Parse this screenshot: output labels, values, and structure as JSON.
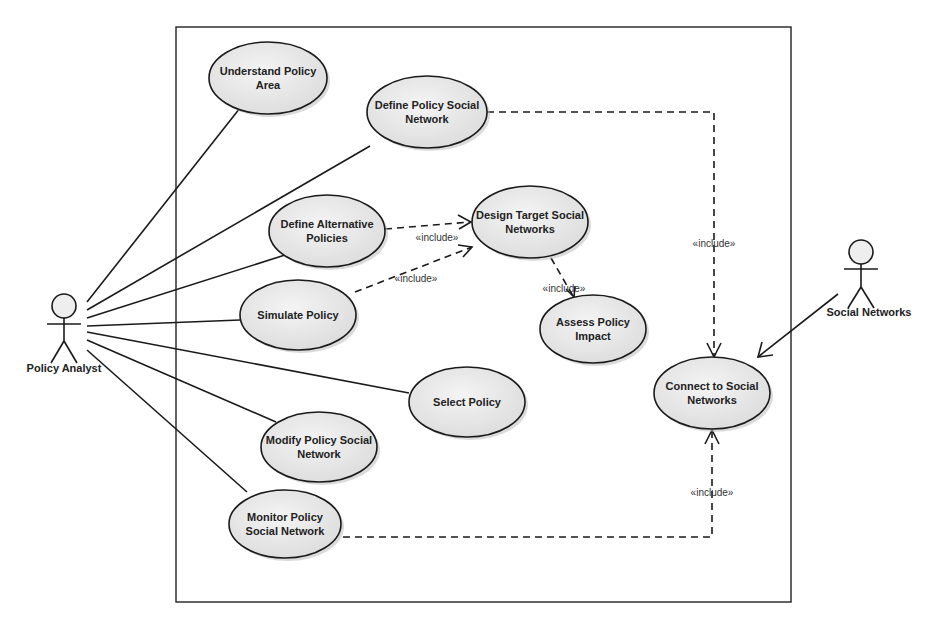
{
  "diagram": {
    "type": "uml-use-case",
    "system_boundary": {
      "x": 176,
      "y": 27,
      "width": 615,
      "height": 575
    },
    "actors": [
      {
        "id": "policy_analyst",
        "label": "Policy Analyst",
        "x": 64,
        "y": 300
      },
      {
        "id": "social_networks",
        "label": "Social Networks",
        "x": 861,
        "y": 263
      }
    ],
    "use_cases": [
      {
        "id": "understand",
        "line1": "Understand Policy",
        "line2": "Area",
        "cx": 268,
        "cy": 78,
        "rx": 59,
        "ry": 36
      },
      {
        "id": "define_psn",
        "line1": "Define Policy Social",
        "line2": "Network",
        "cx": 427,
        "cy": 112,
        "rx": 60,
        "ry": 36
      },
      {
        "id": "define_alt",
        "line1": "Define Alternative",
        "line2": "Policies",
        "cx": 327,
        "cy": 231,
        "rx": 58,
        "ry": 36
      },
      {
        "id": "design_target",
        "line1": "Design Target Social",
        "line2": "Networks",
        "cx": 530,
        "cy": 222,
        "rx": 58,
        "ry": 36
      },
      {
        "id": "simulate",
        "line1": "Simulate Policy",
        "line2": "",
        "cx": 298,
        "cy": 315,
        "rx": 58,
        "ry": 35
      },
      {
        "id": "assess",
        "line1": "Assess Policy",
        "line2": "Impact",
        "cx": 593,
        "cy": 329,
        "rx": 53,
        "ry": 34
      },
      {
        "id": "select",
        "line1": "Select Policy",
        "line2": "",
        "cx": 467,
        "cy": 402,
        "rx": 58,
        "ry": 35
      },
      {
        "id": "modify",
        "line1": "Modify Policy Social",
        "line2": "Network",
        "cx": 319,
        "cy": 447,
        "rx": 58,
        "ry": 35
      },
      {
        "id": "monitor",
        "line1": "Monitor Policy",
        "line2": "Social Network",
        "cx": 285,
        "cy": 524,
        "rx": 56,
        "ry": 34
      },
      {
        "id": "connect",
        "line1": "Connect to Social",
        "line2": "Networks",
        "cx": 712,
        "cy": 393,
        "rx": 58,
        "ry": 36
      }
    ],
    "associations": [
      {
        "from": "policy_analyst",
        "to": "understand"
      },
      {
        "from": "policy_analyst",
        "to": "define_psn"
      },
      {
        "from": "policy_analyst",
        "to": "define_alt"
      },
      {
        "from": "policy_analyst",
        "to": "simulate"
      },
      {
        "from": "policy_analyst",
        "to": "select"
      },
      {
        "from": "policy_analyst",
        "to": "modify"
      },
      {
        "from": "policy_analyst",
        "to": "monitor"
      },
      {
        "from": "social_networks",
        "to": "connect",
        "directed": true
      }
    ],
    "includes": [
      {
        "from": "define_alt",
        "to": "design_target",
        "label": "«include»"
      },
      {
        "from": "simulate",
        "to": "design_target",
        "label": "«include»"
      },
      {
        "from": "design_target",
        "to": "assess",
        "label": "«include»"
      },
      {
        "from": "define_psn",
        "to": "connect",
        "label": "«include»"
      },
      {
        "from": "monitor",
        "to": "connect",
        "label": "«include»"
      }
    ]
  },
  "labels": {
    "include": "«include»"
  }
}
